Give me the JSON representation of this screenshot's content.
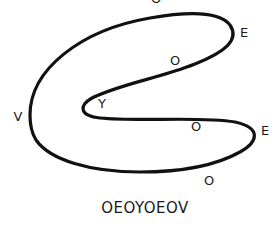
{
  "diagram": {
    "line_color": "#111111",
    "labels": [
      {
        "text": "O",
        "x": 156,
        "y": -2
      },
      {
        "text": "E",
        "x": 244,
        "y": 32
      },
      {
        "text": "O",
        "x": 175,
        "y": 60
      },
      {
        "text": "Y",
        "x": 102,
        "y": 103
      },
      {
        "text": "V",
        "x": 18,
        "y": 116
      },
      {
        "text": "O",
        "x": 196,
        "y": 126
      },
      {
        "text": "E",
        "x": 265,
        "y": 130
      },
      {
        "text": "O",
        "x": 209,
        "y": 180
      }
    ],
    "caption": "OEOYOEOV"
  }
}
